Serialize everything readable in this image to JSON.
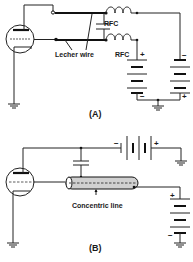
{
  "figure": {
    "colors": {
      "ink": "#1a1a1a",
      "background": "#ffffff",
      "coax_fill": "#cfcfcf"
    },
    "panel_a": {
      "caption": "(A)",
      "labels": {
        "transmission_line": "Lecher wire",
        "choke_upper": "RFC",
        "choke_lower": "RFC",
        "left_battery_top": "+",
        "left_battery_bottom": "−",
        "right_battery_top": "−",
        "right_battery_bottom": "+"
      },
      "components": [
        "triode-tube",
        "lecher-wire-pair",
        "capacitor",
        "rf-choke-upper",
        "rf-choke-lower",
        "battery-left",
        "battery-right",
        "ground-tube",
        "ground-batteries"
      ]
    },
    "panel_b": {
      "caption": "(B)",
      "labels": {
        "transmission_line": "Concentric line",
        "top_battery_left": "−",
        "top_battery_right": "+",
        "right_battery_top": "+",
        "right_battery_bottom": "−"
      },
      "components": [
        "triode-tube",
        "capacitor",
        "concentric-line",
        "battery-top",
        "battery-right",
        "ground-tube",
        "ground-top-battery",
        "ground-right-battery"
      ]
    }
  }
}
